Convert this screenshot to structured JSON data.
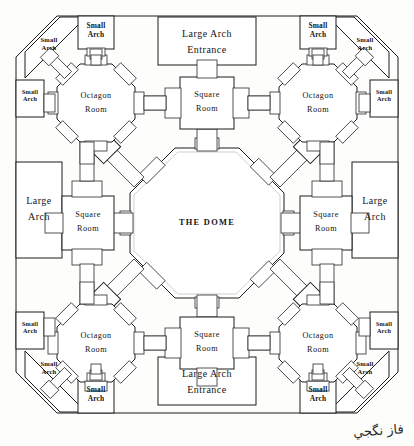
{
  "diagram": {
    "title_center": "THE DOME",
    "signature": "فاز نگجي",
    "line_color": "#1c1c1c",
    "paper_color": "#fdfdfb"
  },
  "entrances": [
    {
      "id": "entrance-top",
      "label": "Large Arch\nEntrance",
      "position": "top"
    },
    {
      "id": "entrance-bottom",
      "label": "Large Arch\nEntrance",
      "position": "bottom"
    }
  ],
  "large_arches": [
    {
      "id": "large-arch-left",
      "label": "Large\nArch",
      "position": "left"
    },
    {
      "id": "large-arch-right",
      "label": "Large\nArch",
      "position": "right"
    }
  ],
  "octagon_rooms": [
    {
      "id": "octagon-room-top-left",
      "label": "Octagon\nRoom",
      "position": "top-left"
    },
    {
      "id": "octagon-room-top-right",
      "label": "Octagon\nRoom",
      "position": "top-right"
    },
    {
      "id": "octagon-room-bottom-left",
      "label": "Octagon\nRoom",
      "position": "bottom-left"
    },
    {
      "id": "octagon-room-bottom-right",
      "label": "Octagon\nRoom",
      "position": "bottom-right"
    }
  ],
  "square_rooms": [
    {
      "id": "square-room-top",
      "label": "Square\nRoom",
      "position": "top"
    },
    {
      "id": "square-room-left",
      "label": "Square\nRoom",
      "position": "left"
    },
    {
      "id": "square-room-right",
      "label": "Square\nRoom",
      "position": "right"
    },
    {
      "id": "square-room-bottom",
      "label": "Square\nRoom",
      "position": "bottom"
    }
  ],
  "small_arches": [
    {
      "id": "small-arch-top-left-outer",
      "label": "Small\nArch",
      "position": "top-left-top"
    },
    {
      "id": "small-arch-top-right-outer",
      "label": "Small\nArch",
      "position": "top-right-top"
    },
    {
      "id": "small-arch-bottom-left-outer",
      "label": "Small\nArch",
      "position": "bottom-left-bottom"
    },
    {
      "id": "small-arch-bottom-right-outer",
      "label": "Small\nArch",
      "position": "bottom-right-bottom"
    },
    {
      "id": "small-arch-left-upper",
      "label": "Small\nArch",
      "position": "left-upper"
    },
    {
      "id": "small-arch-left-lower",
      "label": "Small\nArch",
      "position": "left-lower"
    },
    {
      "id": "small-arch-right-upper",
      "label": "Small\nArch",
      "position": "right-upper"
    },
    {
      "id": "small-arch-right-lower",
      "label": "Small\nArch",
      "position": "right-lower"
    }
  ],
  "corner_small_arches": [
    {
      "id": "corner-arch-top-left",
      "label": "Small\nArch",
      "position": "corner-top-left"
    },
    {
      "id": "corner-arch-top-right",
      "label": "Small\nArch",
      "position": "corner-top-right"
    },
    {
      "id": "corner-arch-bottom-left",
      "label": "Small\nArch",
      "position": "corner-bottom-left"
    },
    {
      "id": "corner-arch-bottom-right",
      "label": "Small\nArch",
      "position": "corner-bottom-right"
    }
  ]
}
